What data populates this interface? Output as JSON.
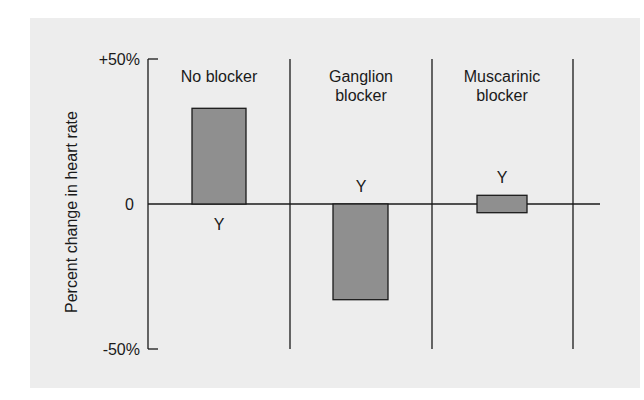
{
  "chart_data": {
    "type": "bar",
    "title": "",
    "xlabel": "",
    "ylabel": "Percent change in heart rate",
    "ylim": [
      -50,
      50
    ],
    "yticks": [
      {
        "value": 50,
        "label": "+50%"
      },
      {
        "value": 0,
        "label": "0"
      },
      {
        "value": -50,
        "label": "-50%"
      }
    ],
    "categories": [
      "No blocker",
      "Ganglion blocker",
      "Muscarinic blocker"
    ],
    "category_lines": [
      [
        "No blocker"
      ],
      [
        "Ganglion",
        "blocker"
      ],
      [
        "Muscarinic",
        "blocker"
      ]
    ],
    "values": [
      33,
      -33,
      3
    ],
    "bar_ranges": [
      [
        0,
        33
      ],
      [
        -33,
        0
      ],
      [
        -3,
        3
      ]
    ],
    "bar_label": "Y",
    "bar_color": "#8f8f8f",
    "grid": false,
    "legend": null
  },
  "colors": {
    "background_panel": "#ededed",
    "axis": "#1a1a1a",
    "bar_fill": "#8f8f8f"
  }
}
